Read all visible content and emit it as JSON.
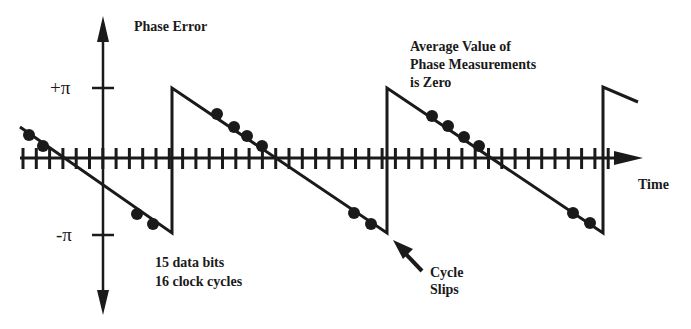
{
  "diagram": {
    "title": "Phase Error",
    "y_axis": {
      "label": "Phase Error",
      "ticks": [
        {
          "label": "+π",
          "value": "+pi"
        },
        {
          "label": "-π",
          "value": "-pi"
        }
      ]
    },
    "x_axis": {
      "label": "Time",
      "tick_count": 47
    },
    "annotations": {
      "average": [
        "Average Value of",
        "Phase Measurements",
        "is Zero"
      ],
      "bits": [
        "15 data bits",
        "16 clock cycles"
      ],
      "slips": [
        "Cycle",
        "Slips"
      ]
    },
    "colors": {
      "ink": "#1a1a1a",
      "background": "#ffffff"
    }
  },
  "chart_data": {
    "type": "line",
    "title": "Phase Error",
    "xlabel": "Time",
    "ylabel": "Phase Error",
    "ylim": [
      "-pi",
      "+pi"
    ],
    "series": [
      {
        "name": "phase error sawtooth",
        "segments": [
          {
            "from": [
              20,
              127
            ],
            "to": [
              172,
              233
            ]
          },
          {
            "from": [
              172,
              233
            ],
            "to": [
              172,
              88
            ]
          },
          {
            "from": [
              172,
              88
            ],
            "to": [
              387,
              233
            ]
          },
          {
            "from": [
              387,
              233
            ],
            "to": [
              387,
              88
            ]
          },
          {
            "from": [
              387,
              88
            ],
            "to": [
              603,
              233
            ]
          },
          {
            "from": [
              603,
              233
            ],
            "to": [
              603,
              87
            ]
          },
          {
            "from": [
              603,
              87
            ],
            "to": [
              638,
              102
            ]
          }
        ]
      }
    ],
    "measurement_points": [
      [
        29,
        135
      ],
      [
        43,
        146
      ],
      [
        137,
        214
      ],
      [
        153,
        224
      ],
      [
        217,
        114
      ],
      [
        234,
        127
      ],
      [
        247,
        136
      ],
      [
        262,
        146
      ],
      [
        354,
        213
      ],
      [
        371,
        224
      ],
      [
        432,
        116
      ],
      [
        448,
        126
      ],
      [
        464,
        137
      ],
      [
        479,
        146
      ],
      [
        573,
        213
      ],
      [
        590,
        223
      ]
    ],
    "legend": []
  }
}
